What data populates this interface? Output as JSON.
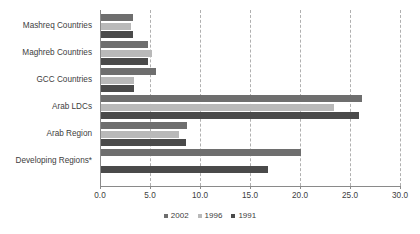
{
  "chart_data": {
    "type": "bar",
    "orientation": "horizontal",
    "title": "",
    "subtitle": "",
    "xlabel": "",
    "ylabel": "",
    "xlim": [
      0.0,
      30.0
    ],
    "xticks": [
      "0.0",
      "5.0",
      "10.0",
      "15.0",
      "20.0",
      "25.0",
      "30.0"
    ],
    "xtick_values": [
      0,
      5,
      10,
      15,
      20,
      25,
      30
    ],
    "grid": "vertical-dashed",
    "legend_position": "bottom-center",
    "categories": [
      "Mashreq Countries",
      "Maghreb Countries",
      "GCC Countries",
      "Arab LDCs",
      "Arab Region",
      "Developing Regions*"
    ],
    "series": [
      {
        "name": "2002",
        "color": "#6e6e6e",
        "values": [
          3.2,
          4.7,
          5.5,
          26.1,
          8.6,
          20.0
        ]
      },
      {
        "name": "1996",
        "color": "#b9b9b9",
        "values": [
          3.0,
          5.1,
          3.3,
          23.3,
          7.8,
          0.0
        ]
      },
      {
        "name": "1991",
        "color": "#4a4a4a",
        "values": [
          3.2,
          4.7,
          3.3,
          25.8,
          8.5,
          16.7
        ]
      }
    ]
  },
  "legend": {
    "items": [
      {
        "label": "2002",
        "color": "#6e6e6e"
      },
      {
        "label": "1996",
        "color": "#b9b9b9"
      },
      {
        "label": "1991",
        "color": "#4a4a4a"
      }
    ]
  },
  "colors": {
    "background": "#ffffff",
    "axis": "#8a8a8a",
    "gridline": "#b0b0b0",
    "text": "#404040"
  }
}
